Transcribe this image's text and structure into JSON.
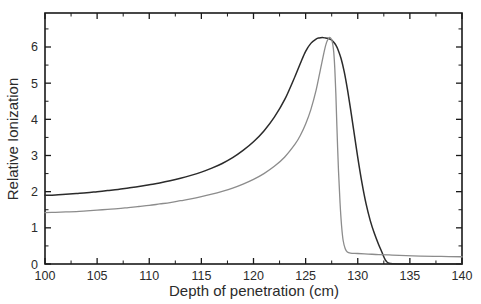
{
  "chart_data": {
    "type": "line",
    "title": "",
    "xlabel": "Depth of penetration (cm)",
    "ylabel": "Relative Ionization",
    "xlim": [
      100,
      140
    ],
    "ylim": [
      0,
      6.94
    ],
    "grid": false,
    "legend": "none",
    "x_major_ticks": [
      100,
      105,
      110,
      115,
      120,
      125,
      130,
      135,
      140
    ],
    "x_tick_labels": [
      "100",
      "105",
      "110",
      "115",
      "120",
      "125",
      "130",
      "135",
      "140"
    ],
    "x_minor_ticks": [
      102.5,
      107.5,
      112.5,
      117.5,
      122.5,
      127.5,
      132.5,
      137.5
    ],
    "y_major_ticks": [
      0,
      1,
      2,
      3,
      4,
      5,
      6
    ],
    "y_tick_labels": [
      "0",
      "1",
      "2",
      "3",
      "4",
      "5",
      "6"
    ],
    "y_minor_ticks": [
      0.5,
      1.5,
      2.5,
      3.5,
      4.5,
      5.5,
      6.5
    ],
    "series": [
      {
        "name": "broad-bragg-peak",
        "color": "#2b2b2b",
        "width": 1.5,
        "x": [
          100,
          101,
          102,
          103,
          104,
          105,
          106,
          107,
          108,
          109,
          110,
          111,
          112,
          113,
          114,
          115,
          116,
          117,
          118,
          119,
          120,
          121,
          122,
          123,
          124,
          124.5,
          125,
          125.5,
          126,
          126.3,
          126.6,
          126.9,
          127.1,
          127.3,
          127.5,
          127.7,
          127.9,
          128.1,
          128.4,
          128.7,
          129,
          129.3,
          129.6,
          130,
          130.4,
          130.8,
          131.2,
          131.6,
          132,
          132.3,
          132.5,
          132.7,
          133,
          134,
          136,
          138,
          140
        ],
        "y": [
          1.9,
          1.91,
          1.93,
          1.95,
          1.97,
          2.0,
          2.03,
          2.06,
          2.1,
          2.14,
          2.19,
          2.24,
          2.3,
          2.37,
          2.45,
          2.54,
          2.65,
          2.78,
          2.94,
          3.14,
          3.38,
          3.68,
          4.06,
          4.55,
          5.2,
          5.55,
          5.88,
          6.1,
          6.22,
          6.25,
          6.26,
          6.25,
          6.24,
          6.22,
          6.19,
          6.13,
          6.05,
          5.93,
          5.68,
          5.32,
          4.85,
          4.3,
          3.72,
          2.95,
          2.25,
          1.66,
          1.2,
          0.84,
          0.54,
          0.34,
          0.2,
          0.09,
          0.02,
          0,
          0,
          0,
          0
        ]
      },
      {
        "name": "sharp-bragg-peak",
        "color": "#8c8c8c",
        "width": 1.3,
        "x": [
          100,
          101,
          102,
          103,
          104,
          105,
          106,
          107,
          108,
          109,
          110,
          111,
          112,
          113,
          114,
          115,
          116,
          117,
          118,
          119,
          120,
          121,
          122,
          123,
          124,
          124.5,
          125,
          125.5,
          126,
          126.4,
          126.8,
          127.0,
          127.2,
          127.35,
          127.5,
          127.6,
          127.7,
          127.8,
          127.9,
          128.0,
          128.15,
          128.3,
          128.45,
          128.6,
          128.8,
          129.0,
          129.3,
          130,
          131,
          132,
          133,
          134,
          136,
          138,
          140
        ],
        "y": [
          1.42,
          1.43,
          1.44,
          1.45,
          1.47,
          1.49,
          1.51,
          1.53,
          1.56,
          1.59,
          1.62,
          1.66,
          1.7,
          1.75,
          1.8,
          1.86,
          1.93,
          2.01,
          2.1,
          2.21,
          2.34,
          2.5,
          2.7,
          2.96,
          3.32,
          3.56,
          3.87,
          4.27,
          4.8,
          5.35,
          5.9,
          6.12,
          6.24,
          6.26,
          6.2,
          6.08,
          5.85,
          5.4,
          4.7,
          3.8,
          2.6,
          1.7,
          1.05,
          0.65,
          0.42,
          0.33,
          0.3,
          0.29,
          0.275,
          0.26,
          0.25,
          0.24,
          0.22,
          0.21,
          0.2
        ]
      }
    ]
  },
  "axes": {
    "x_title": "Depth of penetration (cm)",
    "y_title": "Relative Ionization"
  }
}
